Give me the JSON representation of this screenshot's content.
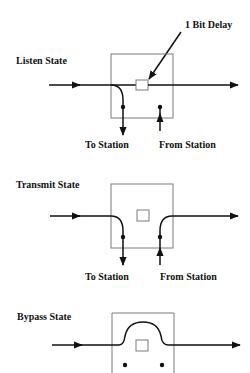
{
  "diagram": {
    "annotation": "1 Bit Delay",
    "colors": {
      "line": "#111111",
      "box": "#7a7a7a",
      "background": "#ffffff"
    },
    "states": [
      {
        "id": "listen",
        "label": "Listen State",
        "to_label": "To Station",
        "from_label": "From Station"
      },
      {
        "id": "transmit",
        "label": "Transmit State",
        "to_label": "To Station",
        "from_label": "From Station"
      },
      {
        "id": "bypass",
        "label": "Bypass State"
      }
    ]
  }
}
